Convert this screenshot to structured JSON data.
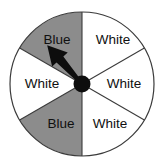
{
  "figure": {
    "name": "probability-spinner",
    "background_color": "#ffffff"
  },
  "spinner": {
    "center": {
      "x": 82,
      "y": 84
    },
    "radius": 72,
    "outline_color": "#3b3b3b",
    "outline_width": 1.2,
    "divider_color": "#3b3b3b",
    "divider_width": 1.1,
    "hub": {
      "name": "spinner-hub",
      "radius": 8.5,
      "color": "#0d0d0d"
    },
    "pointer": {
      "name": "spinner-pointer",
      "color": "#0d0d0d",
      "angle_degrees": 132,
      "length": 52,
      "points_to_sector_index": 0
    },
    "sector_count": 6,
    "colors": {
      "blue_fill": "#8c8c8c",
      "white_fill": "#ffffff",
      "label_color": "#101010"
    },
    "sectors": [
      {
        "index": 0,
        "label": "Blue",
        "fill": "#8c8c8c",
        "start_angle": 90,
        "end_angle": 150,
        "label_x": 57,
        "label_y": 40
      },
      {
        "index": 1,
        "label": "White",
        "fill": "#ffffff",
        "start_angle": 150,
        "end_angle": 210,
        "label_x": 42,
        "label_y": 84
      },
      {
        "index": 2,
        "label": "Blue",
        "fill": "#8c8c8c",
        "start_angle": 210,
        "end_angle": 270,
        "label_x": 61,
        "label_y": 124
      },
      {
        "index": 3,
        "label": "White",
        "fill": "#ffffff",
        "start_angle": 270,
        "end_angle": 330,
        "label_x": 110,
        "label_y": 124
      },
      {
        "index": 4,
        "label": "White",
        "fill": "#ffffff",
        "start_angle": 330,
        "end_angle": 30,
        "label_x": 124,
        "label_y": 84
      },
      {
        "index": 5,
        "label": "White",
        "fill": "#ffffff",
        "start_angle": 30,
        "end_angle": 90,
        "label_x": 113,
        "label_y": 40
      }
    ]
  }
}
